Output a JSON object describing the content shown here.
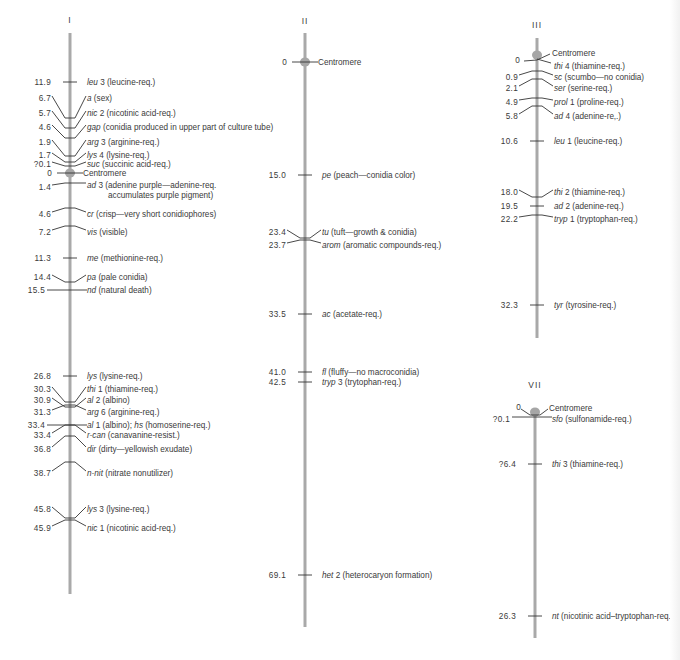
{
  "colors": {
    "rod": "#a9a9a9",
    "centromere": "#a6a6a6",
    "ink": "#333333",
    "text": "#3a3a3a",
    "background": "#ffffff"
  },
  "chromosomes": [
    {
      "id": "I",
      "label": "I",
      "rod": {
        "x": 70,
        "top": 33,
        "bottom": 594
      },
      "label_y": 23,
      "centromere": {
        "y": 173,
        "label": "Centromere",
        "value": "0"
      },
      "loci": [
        {
          "value": "11.9",
          "gene": "leu",
          "suffix": " 3",
          "desc": " (leucine-req.)",
          "num_y": 82,
          "text_y": 82,
          "tick_y": 82,
          "style": "tick"
        },
        {
          "value": "6.7",
          "gene": "a",
          "suffix": "",
          "desc": " (sex)",
          "num_y": 98,
          "text_y": 98,
          "tick_y": 118,
          "style": "bent"
        },
        {
          "value": "5.7",
          "gene": "nic",
          "suffix": " 2",
          "desc": " (nicotinic acid-req.)",
          "num_y": 113,
          "text_y": 113,
          "tick_y": 128,
          "style": "bent"
        },
        {
          "value": "4.6",
          "gene": "gap",
          "suffix": "",
          "desc": " (conidia produced in upper part of culture tube)",
          "num_y": 127,
          "text_y": 127,
          "tick_y": 138,
          "style": "bent"
        },
        {
          "value": "1.9",
          "gene": "arg",
          "suffix": " 3",
          "desc": " (arginine-req.)",
          "num_y": 142,
          "text_y": 142,
          "tick_y": 156,
          "style": "bent"
        },
        {
          "value": "1.7",
          "gene": "lys",
          "suffix": " 4",
          "desc": " (lysine-req.)",
          "num_y": 155,
          "text_y": 155,
          "tick_y": 162,
          "style": "bent"
        },
        {
          "value": "?0.1",
          "gene": "suc",
          "suffix": "",
          "desc": " (succinic acid-req.)",
          "num_y": 164,
          "text_y": 164,
          "tick_y": 166,
          "style": "bent"
        },
        {
          "value": "1.4",
          "gene": "ad",
          "suffix": " 3",
          "desc": " (adenine purple—adenine-req.",
          "desc2": "accumulates purple pigment)",
          "num_y": 187,
          "text_y": 185,
          "tick_y": 183,
          "style": "hump"
        },
        {
          "value": "4.6",
          "gene": "cr",
          "suffix": "",
          "desc": " (crisp—very short conidiophores)",
          "num_y": 214,
          "text_y": 214,
          "tick_y": 208,
          "style": "hump"
        },
        {
          "value": "7.2",
          "gene": "vis",
          "suffix": "",
          "desc": " (visible)",
          "num_y": 232,
          "text_y": 232,
          "tick_y": 226,
          "style": "hump"
        },
        {
          "value": "11.3",
          "gene": "me",
          "suffix": "",
          "desc": " (methionine-req.)",
          "num_y": 258,
          "text_y": 258,
          "tick_y": 258,
          "style": "tick"
        },
        {
          "value": "14.4",
          "gene": "pa",
          "suffix": "",
          "desc": " (pale conidia)",
          "num_y": 277,
          "text_y": 277,
          "tick_y": 282,
          "style": "bent"
        },
        {
          "value": "15.5",
          "gene": "nd",
          "suffix": "",
          "desc": " (natural death)",
          "num_y": 290,
          "text_y": 290,
          "tick_y": 290,
          "style": "cross"
        },
        {
          "value": "26.8",
          "gene": "lys",
          "suffix": "",
          "desc": " (lysine-req.)",
          "num_y": 376,
          "text_y": 376,
          "tick_y": 376,
          "style": "tick"
        },
        {
          "value": "30.3",
          "gene": "thi",
          "suffix": " 1",
          "desc": " (thiamine-req.)",
          "num_y": 389,
          "text_y": 389,
          "tick_y": 402,
          "style": "bent"
        },
        {
          "value": "30.9",
          "gene": "al",
          "suffix": " 2",
          "desc": " (albino)",
          "num_y": 400,
          "text_y": 400,
          "tick_y": 407,
          "style": "bent"
        },
        {
          "value": "31.3",
          "gene": "arg",
          "suffix": " 6",
          "desc": " (arginine-req.)",
          "num_y": 412,
          "text_y": 412,
          "tick_y": 405,
          "style": "hump"
        },
        {
          "value": "33.4",
          "gene": "al",
          "suffix": " 1",
          "desc": " (albino); ",
          "gene2": "hs",
          "desc2b": " (homoserine-req.)",
          "num_y": 425,
          "text_y": 425,
          "tick_y": 425,
          "style": "cross"
        },
        {
          "value": "33.4",
          "gene": "r-can",
          "suffix": "",
          "desc": " (canavanine-resist.)",
          "num_y": 435,
          "text_y": 435,
          "tick_y": 425,
          "style": "hump"
        },
        {
          "value": "36.8",
          "gene": "dir",
          "suffix": "",
          "desc": " (dirty—yellowish exudate)",
          "num_y": 449,
          "text_y": 449,
          "tick_y": 436,
          "style": "hump"
        },
        {
          "value": "38.7",
          "gene": "n-nit",
          "suffix": "",
          "desc": " (nitrate nonutilizer)",
          "num_y": 473,
          "text_y": 473,
          "tick_y": 462,
          "style": "hump"
        },
        {
          "value": "45.8",
          "gene": "lys",
          "suffix": " 3",
          "desc": " (lysine-req.)",
          "num_y": 509,
          "text_y": 509,
          "tick_y": 518,
          "style": "bent"
        },
        {
          "value": "45.9",
          "gene": "nic",
          "suffix": " 1",
          "desc": " (nicotinic acid-req.)",
          "num_y": 528,
          "text_y": 528,
          "tick_y": 520,
          "style": "hump"
        }
      ]
    },
    {
      "id": "II",
      "label": "II",
      "rod": {
        "x": 305,
        "top": 33,
        "bottom": 627
      },
      "label_y": 24,
      "centromere": {
        "y": 62,
        "label": "Centromere",
        "value": "0"
      },
      "loci": [
        {
          "value": "15.0",
          "gene": "pe",
          "suffix": "",
          "desc": " (peach—conidia color)",
          "num_y": 175,
          "text_y": 175,
          "tick_y": 175,
          "style": "tick"
        },
        {
          "value": "23.4",
          "gene": "tu",
          "suffix": "",
          "desc": " (tuft—growth & conidia)",
          "num_y": 232,
          "text_y": 232,
          "tick_y": 238,
          "style": "bent"
        },
        {
          "value": "23.7",
          "gene": "arom",
          "suffix": "",
          "desc": " (aromatic compounds-req.)",
          "num_y": 245,
          "text_y": 245,
          "tick_y": 240,
          "style": "hump"
        },
        {
          "value": "33.5",
          "gene": "ac",
          "suffix": "",
          "desc": " (acetate-req.)",
          "num_y": 314,
          "text_y": 314,
          "tick_y": 314,
          "style": "tick"
        },
        {
          "value": "41.0",
          "gene": "fl",
          "suffix": "",
          "desc": " (fluffy—no macroconidia)",
          "num_y": 372,
          "text_y": 372,
          "tick_y": 372,
          "style": "tick"
        },
        {
          "value": "42.5",
          "gene": "tryp",
          "suffix": " 3",
          "desc": " (trytophan-req.)",
          "num_y": 382,
          "text_y": 382,
          "tick_y": 382,
          "style": "tick"
        },
        {
          "value": "69.1",
          "gene": "het",
          "suffix": " 2",
          "desc": " (heterocaryon formation)",
          "num_y": 575,
          "text_y": 575,
          "tick_y": 575,
          "style": "tick"
        }
      ]
    },
    {
      "id": "III",
      "label": "III",
      "rod": {
        "x": 537,
        "top": 38,
        "bottom": 338
      },
      "label_y": 28,
      "centromere": {
        "y": 55,
        "label": "Centromere",
        "value": "0"
      },
      "loci": [
        {
          "value": "",
          "gene": "thi",
          "suffix": " 4",
          "desc": " (thiamine-req.)",
          "num_y": 66,
          "text_y": 66,
          "tick_y": 60,
          "style": "thi4"
        },
        {
          "value": "0.9",
          "gene": "sc",
          "suffix": "",
          "desc": " (scumbo—no conidia)",
          "num_y": 77,
          "text_y": 77,
          "tick_y": 71,
          "style": "hump"
        },
        {
          "value": "2.1",
          "gene": "ser",
          "suffix": "",
          "desc": " (serine-req.)",
          "num_y": 88,
          "text_y": 88,
          "tick_y": 79,
          "style": "hump"
        },
        {
          "value": "4.9",
          "gene": "prol",
          "suffix": " 1",
          "desc": " (proline-req.)",
          "num_y": 102,
          "text_y": 102,
          "tick_y": 98,
          "style": "hump"
        },
        {
          "value": "5.8",
          "gene": "ad",
          "suffix": " 4",
          "desc": " (adenine-re‚.)",
          "num_y": 116,
          "text_y": 116,
          "tick_y": 106,
          "style": "hump"
        },
        {
          "value": "10.6",
          "gene": "leu",
          "suffix": " 1",
          "desc": " (leucine-req.)",
          "num_y": 141,
          "text_y": 141,
          "tick_y": 141,
          "style": "tick"
        },
        {
          "value": "18.0",
          "gene": "thi",
          "suffix": " 2",
          "desc": " (thiamine-req.)",
          "num_y": 192,
          "text_y": 192,
          "tick_y": 197,
          "style": "bent"
        },
        {
          "value": "19.5",
          "gene": "ad",
          "suffix": " 2",
          "desc": " (adenine-req.)",
          "num_y": 206,
          "text_y": 206,
          "tick_y": 206,
          "style": "tick"
        },
        {
          "value": "22.2",
          "gene": "tryp",
          "suffix": " 1",
          "desc": " (tryptophan-req.)",
          "num_y": 219,
          "text_y": 219,
          "tick_y": 215,
          "style": "hump"
        },
        {
          "value": "32.3",
          "gene": "tyr",
          "suffix": "",
          "desc": " (tyrosine-req.)",
          "num_y": 305,
          "text_y": 305,
          "tick_y": 305,
          "style": "tick"
        }
      ]
    },
    {
      "id": "VII",
      "label": "VII",
      "rod": {
        "x": 535,
        "top": 410,
        "bottom": 638
      },
      "label_y": 388,
      "centromere": {
        "y": 412,
        "label": "Centromere",
        "value": "0"
      },
      "loci": [
        {
          "value": "?0.1",
          "gene": "sfo",
          "suffix": "",
          "desc": " (sulfonamide-req.)",
          "num_y": 419,
          "text_y": 419,
          "tick_y": 417,
          "style": "cross"
        },
        {
          "value": "?6.4",
          "gene": "thi",
          "suffix": " 3",
          "desc": " (thiamine-req.)",
          "num_y": 464,
          "text_y": 464,
          "tick_y": 464,
          "style": "tick"
        },
        {
          "value": "26.3",
          "gene": "nt",
          "suffix": "",
          "desc": " (nicotinic acid–tryptophan-req.)",
          "num_y": 616,
          "text_y": 616,
          "tick_y": 616,
          "style": "tick"
        }
      ]
    }
  ]
}
